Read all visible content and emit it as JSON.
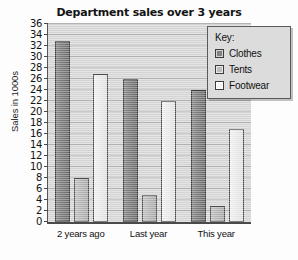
{
  "chart_data": {
    "type": "bar",
    "title": "Department sales over 3 years",
    "xlabel": "",
    "ylabel": "Sales in 1000s",
    "ylim": [
      0,
      36
    ],
    "ytick_step": 2,
    "yticks": [
      0,
      2,
      4,
      6,
      8,
      10,
      12,
      14,
      16,
      18,
      20,
      22,
      24,
      26,
      28,
      30,
      32,
      34,
      36
    ],
    "grid": true,
    "legend_title": "Key:",
    "legend_position": "top-right-inside",
    "categories": [
      "2 years ago",
      "Last year",
      "This year"
    ],
    "series": [
      {
        "name": "Clothes",
        "values": [
          33,
          26,
          24
        ],
        "color": "#7c7c7c"
      },
      {
        "name": "Tents",
        "values": [
          8,
          5,
          3
        ],
        "color": "#b6b6b6"
      },
      {
        "name": "Footwear",
        "values": [
          27,
          22,
          17
        ],
        "color": "#ebebeb"
      }
    ]
  },
  "colors": {
    "plot_background": "#d8d8d8",
    "gridline": "#b4b4b4",
    "axis": "#4a4a4a",
    "legend_background": "#dcdcdc",
    "text": "#111111"
  }
}
